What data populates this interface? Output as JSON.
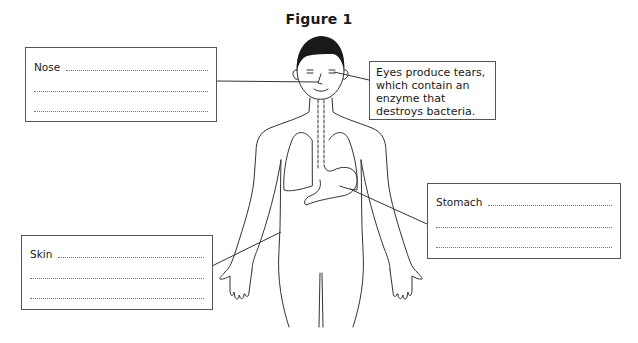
{
  "figure": {
    "title": "Figure 1"
  },
  "labels": {
    "nose": {
      "label": "Nose",
      "answer_lines": 3
    },
    "eyes": {
      "text": "Eyes produce tears, which contain an enzyme that destroys bacteria."
    },
    "stomach": {
      "label": "Stomach",
      "answer_lines": 3
    },
    "skin": {
      "label": "Skin",
      "answer_lines": 3
    }
  },
  "colors": {
    "line": "#333333",
    "hair": "#1a1a1a",
    "box_border": "#555555",
    "dotted": "#777777"
  }
}
